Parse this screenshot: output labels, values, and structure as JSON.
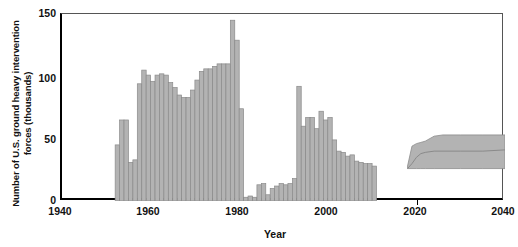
{
  "chart_data": {
    "type": "bar",
    "title": "",
    "xlabel": "Year",
    "ylabel": "Number of U.S. ground heavy intervention forces (thousands)",
    "xlim": [
      1940,
      2040
    ],
    "ylim": [
      0,
      150
    ],
    "xticks": [
      1940,
      1960,
      1980,
      2000,
      2020,
      2040
    ],
    "yticks": [
      0,
      50,
      100,
      150
    ],
    "grid": false,
    "legend": null,
    "bar_color": "#b3b3b3",
    "bar_edge_color": "#8a8a8a",
    "band_color": "#b3b3b3",
    "band_line_color": "#8a8a8a",
    "series": [
      {
        "name": "Historical U.S. ground heavy intervention forces",
        "x": [
          1952,
          1953,
          1954,
          1955,
          1956,
          1957,
          1958,
          1959,
          1960,
          1961,
          1962,
          1963,
          1964,
          1965,
          1966,
          1967,
          1968,
          1969,
          1970,
          1971,
          1972,
          1973,
          1974,
          1975,
          1976,
          1977,
          1978,
          1979,
          1980,
          1981,
          1982,
          1983,
          1984,
          1985,
          1986,
          1987,
          1988,
          1989,
          1990,
          1991,
          1992,
          1993,
          1994,
          1995,
          1996,
          1997,
          1998,
          1999,
          2000,
          2001,
          2002,
          2003,
          2004,
          2005,
          2006,
          2007,
          2008,
          2009,
          2010,
          2011,
          2012,
          2013,
          2014,
          2015,
          2016,
          2017
        ],
        "values": [
          45,
          65,
          65,
          31,
          33,
          94,
          105,
          101,
          96,
          101,
          102,
          101,
          95,
          91,
          85,
          83,
          83,
          89,
          97,
          104,
          106,
          106,
          108,
          110,
          110,
          110,
          145,
          129,
          74,
          3,
          4,
          3,
          13,
          14,
          5,
          10,
          12,
          14,
          13,
          14,
          18,
          92,
          60,
          67,
          67,
          58,
          72,
          65,
          67,
          49,
          40,
          39,
          36,
          37,
          32,
          31,
          30,
          30,
          28,
          2,
          0,
          0,
          0,
          0,
          0,
          0
        ]
      }
    ],
    "bars": [
      {
        "year": 1952,
        "value": 45
      },
      {
        "year": 1953,
        "value": 65
      },
      {
        "year": 1954,
        "value": 65
      },
      {
        "year": 1955,
        "value": 31
      },
      {
        "year": 1956,
        "value": 33
      },
      {
        "year": 1957,
        "value": 94
      },
      {
        "year": 1958,
        "value": 105
      },
      {
        "year": 1959,
        "value": 101
      },
      {
        "year": 1960,
        "value": 96
      },
      {
        "year": 1961,
        "value": 101
      },
      {
        "year": 1962,
        "value": 102
      },
      {
        "year": 1963,
        "value": 101
      },
      {
        "year": 1964,
        "value": 95
      },
      {
        "year": 1965,
        "value": 91
      },
      {
        "year": 1966,
        "value": 85
      },
      {
        "year": 1967,
        "value": 83
      },
      {
        "year": 1968,
        "value": 83
      },
      {
        "year": 1969,
        "value": 89
      },
      {
        "year": 1970,
        "value": 97
      },
      {
        "year": 1971,
        "value": 104
      },
      {
        "year": 1972,
        "value": 106
      },
      {
        "year": 1973,
        "value": 106
      },
      {
        "year": 1974,
        "value": 108
      },
      {
        "year": 1975,
        "value": 110
      },
      {
        "year": 1976,
        "value": 110
      },
      {
        "year": 1977,
        "value": 110
      },
      {
        "year": 1978,
        "value": 145
      },
      {
        "year": 1979,
        "value": 129
      },
      {
        "year": 1980,
        "value": 74
      },
      {
        "year": 1981,
        "value": 3
      },
      {
        "year": 1982,
        "value": 4
      },
      {
        "year": 1983,
        "value": 3
      },
      {
        "year": 1984,
        "value": 13
      },
      {
        "year": 1985,
        "value": 14
      },
      {
        "year": 1986,
        "value": 5
      },
      {
        "year": 1987,
        "value": 10
      },
      {
        "year": 1988,
        "value": 12
      },
      {
        "year": 1989,
        "value": 14
      },
      {
        "year": 1990,
        "value": 13
      },
      {
        "year": 1991,
        "value": 14
      },
      {
        "year": 1992,
        "value": 18
      },
      {
        "year": 1993,
        "value": 92
      },
      {
        "year": 1994,
        "value": 60
      },
      {
        "year": 1995,
        "value": 67
      },
      {
        "year": 1996,
        "value": 67
      },
      {
        "year": 1997,
        "value": 58
      },
      {
        "year": 1998,
        "value": 72
      },
      {
        "year": 1999,
        "value": 65
      },
      {
        "year": 2000,
        "value": 67
      },
      {
        "year": 2001,
        "value": 49
      },
      {
        "year": 2002,
        "value": 40
      },
      {
        "year": 2003,
        "value": 39
      },
      {
        "year": 2004,
        "value": 36
      },
      {
        "year": 2005,
        "value": 37
      },
      {
        "year": 2006,
        "value": 32
      },
      {
        "year": 2007,
        "value": 31
      },
      {
        "year": 2008,
        "value": 30
      },
      {
        "year": 2009,
        "value": 30
      },
      {
        "year": 2010,
        "value": 28
      }
    ],
    "projection_band": {
      "name": "Projected range",
      "x": [
        2018,
        2019,
        2020,
        2021,
        2022,
        2024,
        2026,
        2030,
        2035,
        2040
      ],
      "lower": [
        26,
        26,
        26,
        26,
        26,
        26,
        26,
        26,
        26,
        26
      ],
      "upper": [
        28,
        44,
        46,
        47,
        48,
        52,
        53,
        53,
        53,
        53
      ],
      "median": [
        26,
        30,
        35,
        38,
        39,
        40,
        40,
        40,
        40,
        41
      ]
    }
  }
}
